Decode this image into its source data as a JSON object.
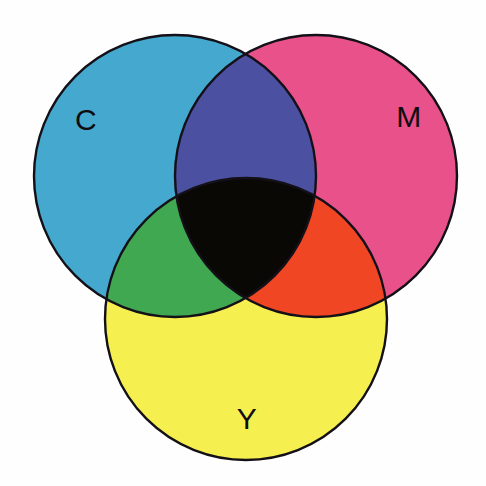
{
  "figure": {
    "type": "venn-diagram",
    "background_color": "#fefefe",
    "stroke_color": "#141018",
    "stroke_width": 2.4,
    "width": 486,
    "height": 486
  },
  "chart_data": {
    "type": "venn",
    "title": "",
    "subtitle": "",
    "xlabel": "",
    "ylabel": "",
    "legend_position": "none",
    "grid": false,
    "sets": [
      {
        "id": "C",
        "label": "C",
        "name": "Cyan",
        "color": "#45a8ce",
        "cx": 175,
        "cy": 176,
        "r": 141,
        "label_x": 86,
        "label_y": 122
      },
      {
        "id": "M",
        "label": "M",
        "name": "Magenta",
        "color": "#e8518a",
        "cx": 316,
        "cy": 176,
        "r": 141,
        "label_x": 409,
        "label_y": 119
      },
      {
        "id": "Y",
        "label": "Y",
        "name": "Yellow",
        "color": "#f5ef4f",
        "cx": 246,
        "cy": 319,
        "r": 141,
        "label_x": 247,
        "label_y": 421
      }
    ],
    "intersections": [
      {
        "id": "CM",
        "sets": [
          "C",
          "M"
        ],
        "name": "Blue",
        "color": "#4b50a0"
      },
      {
        "id": "CY",
        "sets": [
          "C",
          "Y"
        ],
        "name": "Green",
        "color": "#3fa851"
      },
      {
        "id": "MY",
        "sets": [
          "M",
          "Y"
        ],
        "name": "Red",
        "color": "#f04623"
      },
      {
        "id": "CMY",
        "sets": [
          "C",
          "M",
          "Y"
        ],
        "name": "Black",
        "color": "#0a0805"
      }
    ]
  }
}
